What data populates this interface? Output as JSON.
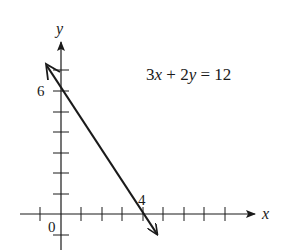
{
  "chart_data": {
    "type": "line",
    "title": "",
    "equation": "3x + 2y = 12",
    "xlabel": "x",
    "ylabel": "y",
    "xlim": [
      -1,
      9
    ],
    "ylim": [
      -1,
      7
    ],
    "grid": false,
    "x_ticks": [
      -1,
      1,
      2,
      3,
      4,
      5,
      6,
      7,
      8
    ],
    "y_ticks": [
      -1,
      1,
      2,
      3,
      4,
      5,
      6,
      7
    ],
    "tick_labels": [
      {
        "axis": "x",
        "value": 4,
        "text": "4"
      },
      {
        "axis": "y",
        "value": 6,
        "text": "6"
      },
      {
        "axis": "origin",
        "value": 0,
        "text": "0"
      }
    ],
    "series": [
      {
        "name": "3x + 2y = 12",
        "x": [
          -0.7,
          0,
          4,
          4.6
        ],
        "y": [
          7.05,
          6,
          0,
          -0.9
        ],
        "intercepts": {
          "x_intercept": [
            4,
            0
          ],
          "y_intercept": [
            0,
            6
          ]
        },
        "arrows_both_ends": true,
        "color": "#1a1a1a"
      }
    ]
  },
  "labels": {
    "equation": "3x + 2y = 12",
    "x_axis": "x",
    "y_axis": "y",
    "y6": "6",
    "x4": "4",
    "origin": "0"
  },
  "colors": {
    "ink": "#1a1a1a",
    "background": "#ffffff"
  }
}
